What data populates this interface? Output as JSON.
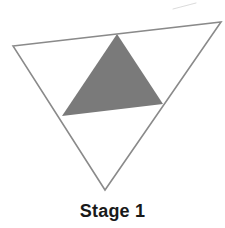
{
  "figure": {
    "caption": "Stage 1",
    "background_color": "#ffffff",
    "outline_color": "#8a8a8a",
    "fill_color": "#7a7a7a",
    "caption_color": "#191919",
    "stray_mark_color": "#cfcfcf"
  },
  "chart_data": {
    "type": "diagram",
    "title": "Stage 1",
    "shapes": [
      {
        "name": "outer-triangle",
        "role": "outline",
        "fill": "none",
        "stroke": "#8a8a8a",
        "stroke_width": 1.6,
        "points": [
          [
            13,
            46
          ],
          [
            221,
            22
          ],
          [
            105,
            190
          ]
        ]
      },
      {
        "name": "inner-shaded-triangle",
        "role": "shaded-middle-triangle",
        "fill": "#7a7a7a",
        "stroke": "none",
        "points": [
          [
            117,
            34
          ],
          [
            163,
            104
          ],
          [
            62,
            116
          ]
        ]
      },
      {
        "name": "stray-mark",
        "role": "scan-artifact",
        "fill": "none",
        "stroke": "#cfcfcf",
        "stroke_width": 1,
        "points": [
          [
            173,
            9
          ],
          [
            196,
            3
          ]
        ]
      }
    ],
    "counts": {
      "shaded_triangles": 1,
      "unshaded_triangles": 3,
      "total_subdivisions": 4
    },
    "xlabel": "",
    "ylabel": "",
    "grid": false,
    "legend": null
  }
}
